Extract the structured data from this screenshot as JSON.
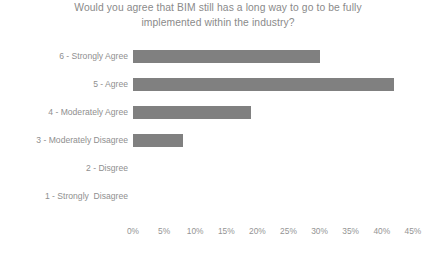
{
  "chart_data": {
    "type": "bar",
    "orientation": "horizontal",
    "title": "Would you agree that BIM still has a long way to go to be fully\nimplemented within the industry?",
    "xlabel": "",
    "ylabel": "",
    "xlim": [
      0,
      45
    ],
    "grid": false,
    "legend": null,
    "bar_color": "#808080",
    "categories": [
      "6 - Strongly Agree",
      "5 - Agree",
      "4 - Moderately Agree",
      "3 - Moderately Disagree",
      "2 - Disgree",
      "1 - Strongly  Disagree"
    ],
    "values": [
      30,
      42,
      19,
      8,
      0,
      0
    ],
    "value_labels": [
      "30%",
      "42%",
      "19%",
      "8%",
      "0%",
      "0%"
    ],
    "xticks": [
      0,
      5,
      10,
      15,
      20,
      25,
      30,
      35,
      40,
      45
    ],
    "xticklabels": [
      "0%",
      "5%",
      "10%",
      "15%",
      "20%",
      "25%",
      "30%",
      "35%",
      "40%",
      "45%"
    ]
  }
}
